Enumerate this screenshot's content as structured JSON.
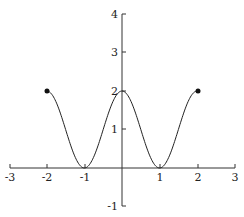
{
  "chart_data": {
    "type": "line",
    "title": "",
    "xlabel": "",
    "ylabel": "",
    "xlim": [
      -3,
      3
    ],
    "ylim": [
      -1,
      4
    ],
    "grid": false,
    "x_ticks": [
      "-3",
      "-2",
      "-1",
      "1",
      "2",
      "3"
    ],
    "y_ticks": [
      "4",
      "3",
      "2",
      "1",
      "-1"
    ],
    "series": [
      {
        "name": "f(x) = 1 + cos(πx)",
        "x": [
          -2,
          -1.5,
          -1,
          -0.5,
          0,
          0.5,
          1,
          1.5,
          2
        ],
        "values": [
          2,
          1,
          0,
          1,
          2,
          1,
          0,
          1,
          2
        ]
      }
    ],
    "endpoints": [
      {
        "x": -2,
        "y": 2,
        "style": "filled"
      },
      {
        "x": 2,
        "y": 2,
        "style": "filled"
      }
    ]
  },
  "labels": {
    "x": {
      "m3": "-3",
      "m2": "-2",
      "m1": "-1",
      "p1": "1",
      "p2": "2",
      "p3": "3"
    },
    "y": {
      "p4": "4",
      "p3": "3",
      "p2": "2",
      "p1": "1",
      "m1": "-1"
    }
  }
}
